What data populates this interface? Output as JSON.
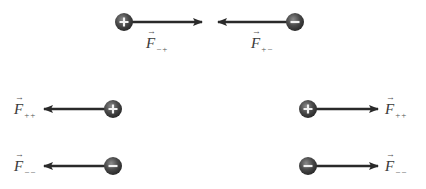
{
  "diagram": {
    "colors": {
      "arrow": "#2a2a2a",
      "charge_fill_outer": "#3c3c3c",
      "charge_fill_inner": "#8a8a8a",
      "charge_sign": "#f2f2f2",
      "label": "#3a3a3a"
    },
    "pairs": [
      {
        "id": "attraction-top",
        "charges": [
          {
            "sign": "+",
            "cx": 124,
            "cy": 22,
            "arrow_to_x": 202,
            "label": {
              "symbol": "F",
              "sub": "−+",
              "x": 146,
              "y": 36
            }
          },
          {
            "sign": "−",
            "cx": 295,
            "cy": 22,
            "arrow_to_x": 218,
            "label": {
              "symbol": "F",
              "sub": "+−",
              "x": 251,
              "y": 36
            }
          }
        ]
      },
      {
        "id": "repulsion-plus-plus",
        "charges": [
          {
            "sign": "+",
            "cx": 113,
            "cy": 109,
            "arrow_to_x": 44,
            "label": {
              "symbol": "F",
              "sub": "++",
              "x": 14,
              "y": 102
            }
          },
          {
            "sign": "+",
            "cx": 308,
            "cy": 109,
            "arrow_to_x": 378,
            "label": {
              "symbol": "F",
              "sub": "++",
              "x": 385,
              "y": 102
            }
          }
        ]
      },
      {
        "id": "repulsion-minus-minus",
        "charges": [
          {
            "sign": "−",
            "cx": 113,
            "cy": 166,
            "arrow_to_x": 44,
            "label": {
              "symbol": "F",
              "sub": "−−",
              "x": 14,
              "y": 159
            }
          },
          {
            "sign": "−",
            "cx": 308,
            "cy": 166,
            "arrow_to_x": 378,
            "label": {
              "symbol": "F",
              "sub": "−−",
              "x": 385,
              "y": 159
            }
          }
        ]
      }
    ],
    "labels": {
      "top_left": {
        "symbol": "F",
        "sub": "−+"
      },
      "top_right": {
        "symbol": "F",
        "sub": "+−"
      },
      "mid_left": {
        "symbol": "F",
        "sub": "++"
      },
      "mid_right": {
        "symbol": "F",
        "sub": "++"
      },
      "bot_left": {
        "symbol": "F",
        "sub": "−−"
      },
      "bot_right": {
        "symbol": "F",
        "sub": "−−"
      }
    },
    "signs": {
      "plus": "+",
      "minus": "−"
    }
  }
}
